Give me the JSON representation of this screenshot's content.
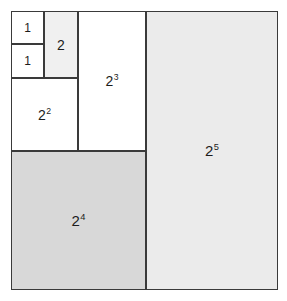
{
  "figure": {
    "background_color": "#ffffff",
    "stroke_color": "#3a3a3a",
    "text_color": "#1c1c1c",
    "fill_white": "#ffffff",
    "fill_light_gray": "#f0f0f0",
    "fill_gray": "#ebebeb",
    "fill_dark_gray": "#d8d8d8",
    "outer_square": {
      "x": 11,
      "y": 11,
      "width": 267,
      "height": 279
    }
  },
  "chart_data": {
    "type": "diagram",
    "regions": [
      {
        "name": "one-top",
        "base": "1",
        "exponent": "",
        "label": "1",
        "fill": "#ffffff",
        "x": 11,
        "y": 11,
        "width": 33,
        "height": 33
      },
      {
        "name": "one-bottom",
        "base": "1",
        "exponent": "",
        "label": "1",
        "fill": "#ffffff",
        "x": 11,
        "y": 44,
        "width": 33,
        "height": 34
      },
      {
        "name": "two",
        "base": "2",
        "exponent": "",
        "label": "2",
        "fill": "#f0f0f0",
        "x": 44,
        "y": 11,
        "width": 34,
        "height": 67
      },
      {
        "name": "two-squared",
        "base": "2",
        "exponent": "2",
        "label": "2²",
        "fill": "#ffffff",
        "x": 11,
        "y": 78,
        "width": 67,
        "height": 73
      },
      {
        "name": "two-cubed",
        "base": "2",
        "exponent": "3",
        "label": "2³",
        "fill": "#ffffff",
        "x": 78,
        "y": 11,
        "width": 68,
        "height": 140
      },
      {
        "name": "two-fourth",
        "base": "2",
        "exponent": "4",
        "label": "2⁴",
        "fill": "#d8d8d8",
        "x": 11,
        "y": 151,
        "width": 135,
        "height": 139
      },
      {
        "name": "two-fifth",
        "base": "2",
        "exponent": "5",
        "label": "2⁵",
        "fill": "#ebebeb",
        "x": 146,
        "y": 11,
        "width": 132,
        "height": 279
      }
    ]
  }
}
